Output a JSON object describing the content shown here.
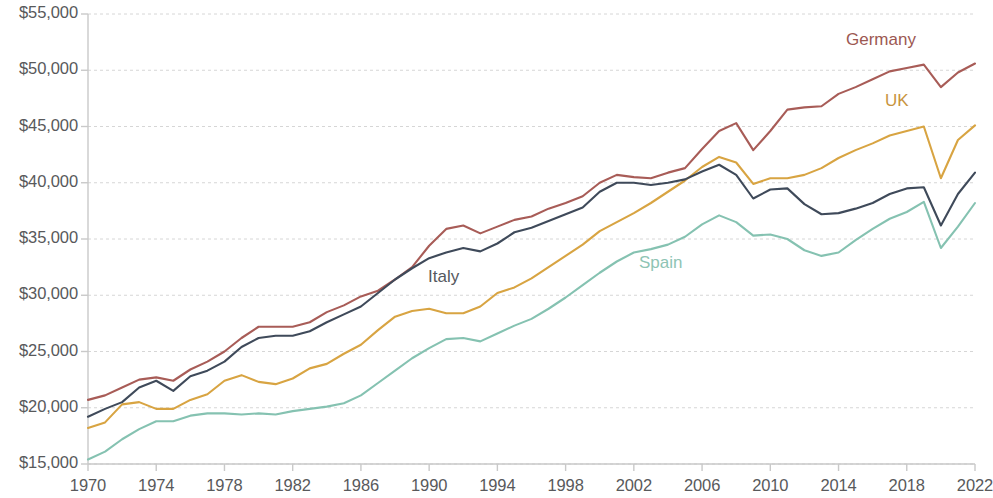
{
  "chart_data": {
    "type": "line",
    "title": "",
    "subtitle": "",
    "xlabel": "",
    "ylabel": "",
    "xlim": [
      1970,
      2022
    ],
    "ylim": [
      15000,
      55000
    ],
    "grid": true,
    "legend_position": "inline-labels",
    "y_tick_labels": [
      "$55,000",
      "$50,000",
      "$45,000",
      "$40,000",
      "$35,000",
      "$30,000",
      "$25,000",
      "$20,000",
      "$15,000"
    ],
    "y_tick_values": [
      55000,
      50000,
      45000,
      40000,
      35000,
      30000,
      25000,
      20000,
      15000
    ],
    "x_tick_labels": [
      "1970",
      "1974",
      "1978",
      "1982",
      "1986",
      "1990",
      "1994",
      "1998",
      "2002",
      "2006",
      "2010",
      "2014",
      "2018",
      "2022"
    ],
    "x_tick_values": [
      1970,
      1974,
      1978,
      1982,
      1986,
      1990,
      1994,
      1998,
      2002,
      2006,
      2010,
      2014,
      2018,
      2022
    ],
    "x": [
      1970,
      1971,
      1972,
      1973,
      1974,
      1975,
      1976,
      1977,
      1978,
      1979,
      1980,
      1981,
      1982,
      1983,
      1984,
      1985,
      1986,
      1987,
      1988,
      1989,
      1990,
      1991,
      1992,
      1993,
      1994,
      1995,
      1996,
      1997,
      1998,
      1999,
      2000,
      2001,
      2002,
      2003,
      2004,
      2005,
      2006,
      2007,
      2008,
      2009,
      2010,
      2011,
      2012,
      2013,
      2014,
      2015,
      2016,
      2017,
      2018,
      2019,
      2020,
      2021,
      2022
    ],
    "series": [
      {
        "name": "Germany",
        "color": "#a85c57",
        "label_color": "#9c5852",
        "label_x": 846,
        "label_y": 30,
        "values": [
          20700,
          21100,
          21800,
          22500,
          22700,
          22400,
          23400,
          24100,
          25000,
          26200,
          27200,
          27200,
          27200,
          27600,
          28500,
          29100,
          29900,
          30400,
          31400,
          32500,
          34400,
          35900,
          36200,
          35500,
          36100,
          36700,
          37000,
          37700,
          38200,
          38800,
          40000,
          40700,
          40500,
          40400,
          40900,
          41300,
          43000,
          44600,
          45300,
          42900,
          44600,
          46500,
          46700,
          46800,
          47900,
          48500,
          49200,
          49900,
          50200,
          50500,
          48500,
          49800,
          50600
        ]
      },
      {
        "name": "UK",
        "color": "#d8a442",
        "label_color": "#c89440",
        "label_x": 885,
        "label_y": 91,
        "values": [
          18200,
          18700,
          20300,
          20500,
          19900,
          19900,
          20700,
          21200,
          22400,
          22900,
          22300,
          22100,
          22600,
          23500,
          23900,
          24800,
          25600,
          26900,
          28100,
          28600,
          28800,
          28400,
          28400,
          29000,
          30200,
          30700,
          31500,
          32500,
          33500,
          34500,
          35700,
          36500,
          37300,
          38200,
          39200,
          40200,
          41400,
          42300,
          41800,
          39900,
          40400,
          40400,
          40700,
          41300,
          42200,
          42900,
          43500,
          44200,
          44600,
          45000,
          40400,
          43800,
          45100
        ]
      },
      {
        "name": "Italy",
        "color": "#3f4a5a",
        "label_color": "#55595e",
        "label_x": 428,
        "label_y": 267,
        "values": [
          19200,
          19900,
          20500,
          21800,
          22400,
          21500,
          22800,
          23300,
          24100,
          25400,
          26200,
          26400,
          26400,
          26800,
          27600,
          28300,
          29000,
          30200,
          31400,
          32400,
          33300,
          33800,
          34200,
          33900,
          34600,
          35600,
          36000,
          36600,
          37200,
          37800,
          39200,
          40000,
          40000,
          39800,
          40000,
          40300,
          41000,
          41600,
          40700,
          38600,
          39400,
          39500,
          38100,
          37200,
          37300,
          37700,
          38200,
          39000,
          39500,
          39600,
          36200,
          39000,
          40900
        ]
      },
      {
        "name": "Spain",
        "color": "#85c2b1",
        "label_color": "#8ec4b4",
        "label_x": 639,
        "label_y": 253,
        "values": [
          15400,
          16100,
          17200,
          18100,
          18800,
          18800,
          19300,
          19500,
          19500,
          19400,
          19500,
          19400,
          19700,
          19900,
          20100,
          20400,
          21100,
          22200,
          23300,
          24400,
          25300,
          26100,
          26200,
          25900,
          26600,
          27300,
          27900,
          28800,
          29800,
          30900,
          32000,
          33000,
          33800,
          34100,
          34500,
          35200,
          36300,
          37100,
          36500,
          35300,
          35400,
          35000,
          34000,
          33500,
          33800,
          34900,
          35900,
          36800,
          37400,
          38300,
          34200,
          36100,
          38200
        ]
      }
    ]
  },
  "axis": {
    "axis_color": "#c9c9c9",
    "grid_color": "#d6d6d6",
    "tick_text_color": "#58595b"
  }
}
